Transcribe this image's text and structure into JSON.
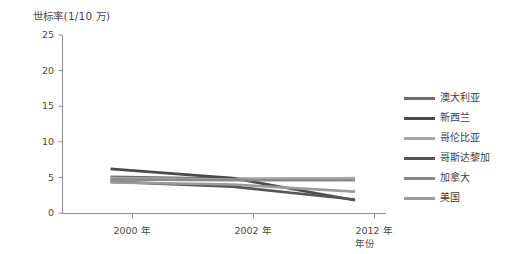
{
  "chart_data": {
    "type": "line",
    "title": "",
    "ylabel": "世标率(1/10 万)",
    "xlabel": "年份",
    "categories": [
      "2000 年",
      "2002 年",
      "2012 年"
    ],
    "ylim": [
      0,
      25
    ],
    "yticks": [
      0,
      5,
      10,
      15,
      20,
      25
    ],
    "ytick_labels": [
      "0",
      "5",
      "10",
      "15",
      "20",
      "25"
    ],
    "grid": false,
    "legend_position": "right",
    "series": [
      {
        "name": "澳大利亚",
        "color": "#6e6e6e",
        "values": [
          5.1,
          4.8,
          4.8
        ]
      },
      {
        "name": "新西兰",
        "color": "#4a4a4a",
        "values": [
          6.2,
          4.9,
          1.8
        ]
      },
      {
        "name": "哥伦比亚",
        "color": "#a6a6a6",
        "values": [
          4.9,
          4.7,
          4.9
        ]
      },
      {
        "name": "哥斯达黎加",
        "color": "#565656",
        "values": [
          4.4,
          3.7,
          1.9
        ]
      },
      {
        "name": "加拿大",
        "color": "#8a8a8a",
        "values": [
          4.7,
          4.6,
          4.6
        ]
      },
      {
        "name": "美国",
        "color": "#9b9b9b",
        "values": [
          4.3,
          4.0,
          3.0
        ]
      }
    ]
  },
  "axis": {
    "y_title": "世标率(1/10 万)",
    "x_title": "年份"
  }
}
